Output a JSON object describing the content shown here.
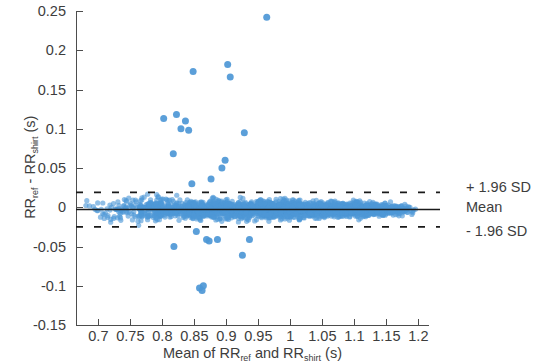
{
  "chart_data": {
    "type": "scatter",
    "title": "",
    "xlabel": "Mean of RR_ref and RR_shirt (s)",
    "ylabel": "RR_ref - RR_shirt (s)",
    "xlabel_parts": {
      "prefix": "Mean of RR",
      "sub1": "ref",
      "middle": " and RR",
      "sub2": "shirt",
      "suffix": " (s)"
    },
    "ylabel_parts": {
      "prefix": "RR",
      "sub1": "ref",
      "middle": " - RR",
      "sub2": "shirt",
      "suffix": " (s)"
    },
    "xlim": [
      0.665,
      1.215
    ],
    "ylim": [
      -0.15,
      0.25
    ],
    "xticks": [
      0.7,
      0.75,
      0.8,
      0.85,
      0.9,
      0.95,
      1,
      1.05,
      1.1,
      1.15,
      1.2
    ],
    "xticklabels": [
      "0.7",
      "0.75",
      "0.8",
      "0.85",
      "0.9",
      "0.95",
      "1",
      "1.05",
      "1.1",
      "1.15",
      "1.2"
    ],
    "yticks": [
      -0.15,
      -0.1,
      -0.05,
      0,
      0.05,
      0.1,
      0.15,
      0.2,
      0.25
    ],
    "yticklabels": [
      "-0.15",
      "-0.1",
      "-0.05",
      "0",
      "0.05",
      "0.1",
      "0.15",
      "0.2",
      "0.25"
    ],
    "grid": false,
    "legend_position": "right-outside",
    "marker_color": "#4d97d6",
    "mean_line_color": "#1a1a1a",
    "loa_line_color": "#1a1a1a",
    "mean": -0.003,
    "upper_loa": 0.019,
    "lower_loa": -0.025,
    "annotations": [
      {
        "name": "upper-loa-label",
        "label": "+ 1.96 SD",
        "value": 0.019
      },
      {
        "name": "mean-label",
        "label": "Mean",
        "value": -0.003
      },
      {
        "name": "lower-loa-label",
        "label": "- 1.96 SD",
        "value": -0.025
      }
    ],
    "outliers": [
      {
        "x": 0.963,
        "y": 0.242
      },
      {
        "x": 0.902,
        "y": 0.182
      },
      {
        "x": 0.848,
        "y": 0.173
      },
      {
        "x": 0.906,
        "y": 0.166
      },
      {
        "x": 0.822,
        "y": 0.118
      },
      {
        "x": 0.836,
        "y": 0.11
      },
      {
        "x": 0.802,
        "y": 0.113
      },
      {
        "x": 0.829,
        "y": 0.1
      },
      {
        "x": 0.841,
        "y": 0.098
      },
      {
        "x": 0.928,
        "y": 0.095
      },
      {
        "x": 0.817,
        "y": 0.068
      },
      {
        "x": 0.898,
        "y": 0.06
      },
      {
        "x": 0.893,
        "y": 0.05
      },
      {
        "x": 0.876,
        "y": 0.036
      },
      {
        "x": 0.846,
        "y": 0.03
      },
      {
        "x": 0.853,
        "y": -0.031
      },
      {
        "x": 0.869,
        "y": -0.041
      },
      {
        "x": 0.873,
        "y": -0.043
      },
      {
        "x": 0.886,
        "y": -0.041
      },
      {
        "x": 0.936,
        "y": -0.041
      },
      {
        "x": 0.818,
        "y": -0.05
      },
      {
        "x": 0.925,
        "y": -0.061
      },
      {
        "x": 0.858,
        "y": -0.103
      },
      {
        "x": 0.862,
        "y": -0.106
      },
      {
        "x": 0.864,
        "y": -0.1
      }
    ],
    "cluster_description": "Dense band of paired RR interval differences centred near zero, spanning mean values from about 0.67 s to 1.20 s, with spread roughly +/- 0.012 s narrowing toward the right."
  },
  "figure": {
    "width": 540,
    "height": 364,
    "background": "#ffffff"
  }
}
